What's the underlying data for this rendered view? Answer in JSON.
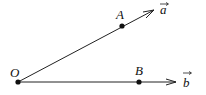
{
  "diagram": {
    "points": {
      "O": {
        "label": "O",
        "x": 18,
        "y": 82
      },
      "A": {
        "label": "A",
        "x": 122,
        "y": 26
      },
      "B": {
        "label": "B",
        "x": 139,
        "y": 82
      }
    },
    "vectors": {
      "a": {
        "label": "a",
        "from": "O",
        "through": "A",
        "arrow_tip": [
          154,
          10
        ]
      },
      "b": {
        "label": "b",
        "from": "O",
        "through": "B",
        "arrow_tip": [
          176,
          82
        ]
      }
    },
    "colors": {
      "stroke": "#222222",
      "point": "#111111",
      "background": "#ffffff"
    }
  }
}
